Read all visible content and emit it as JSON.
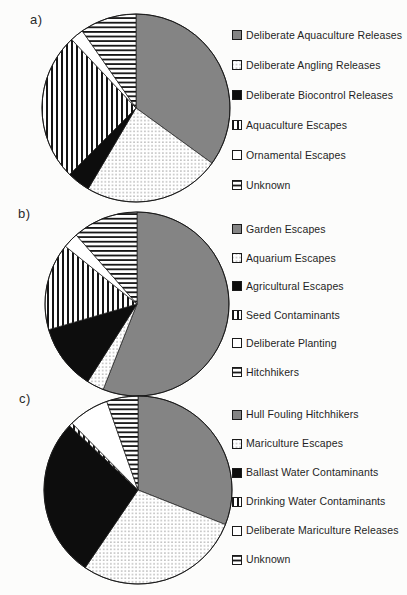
{
  "figure": {
    "description_visible_panels": [
      "a)",
      "b)",
      "c)"
    ]
  },
  "colors": {
    "gray_fill": "#848484",
    "black_fill": "#0d0d0d",
    "white_fill": "#ffffff",
    "pattern_ink": "#151515",
    "outline": "#1a1a1a",
    "text": "#1f1f1f",
    "background": "#fcfcfb"
  },
  "chart_data": [
    {
      "type": "pie",
      "panel_label": "a)",
      "legend_position": "right",
      "labels": [
        "Deliberate Aquaculture Releases",
        "Deliberate Angling Releases",
        "Deliberate Biocontrol Releases",
        "Aquaculture Escapes",
        "Ornamental Escapes",
        "Unknown"
      ],
      "values_percent": [
        35,
        23.5,
        4,
        25.5,
        2.3,
        9.7
      ],
      "patterns": [
        "gray",
        "dots",
        "black",
        "vlines",
        "white",
        "hlines"
      ]
    },
    {
      "type": "pie",
      "panel_label": "b)",
      "legend_position": "right",
      "labels": [
        "Garden Escapes",
        "Aquarium Escapes",
        "Agricultural Escapes",
        "Seed Contaminants",
        "Deliberate Planting",
        "Hitchhikers"
      ],
      "values_percent": [
        56,
        3,
        11.5,
        15.3,
        2.7,
        11.5
      ],
      "patterns": [
        "gray",
        "dots",
        "black",
        "vlines",
        "white",
        "hlines"
      ]
    },
    {
      "type": "pie",
      "panel_label": "c)",
      "legend_position": "right",
      "labels": [
        "Hull Fouling Hitchhikers",
        "Mariculture Escapes",
        "Ballast Water Contaminants",
        "Drinking Water Contaminants",
        "Deliberate Mariculture Releases",
        "Unknown"
      ],
      "values_percent": [
        31,
        28.5,
        27.5,
        0.6,
        7,
        5.4
      ],
      "patterns": [
        "gray",
        "dots",
        "black",
        "vlines",
        "white",
        "hlines"
      ]
    }
  ]
}
